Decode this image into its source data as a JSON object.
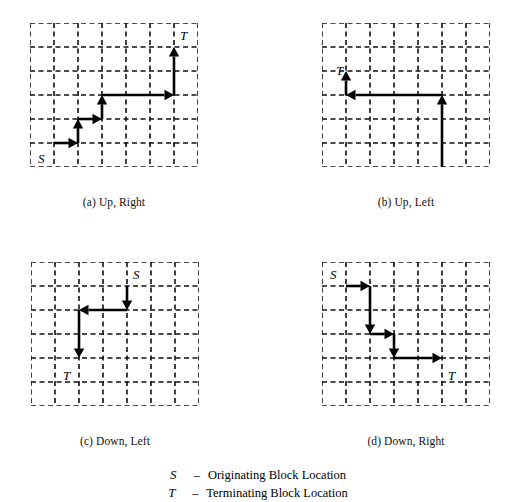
{
  "figure": {
    "grid": {
      "cell": 24,
      "cols": 7,
      "rows": 6,
      "line_color": "#111111",
      "dash": "5,3.5",
      "line_width": 1.6
    },
    "path_color": "#000000",
    "path_width": 2.6
  },
  "panels": [
    {
      "id": "a",
      "caption": "(a) Up, Right",
      "start_label": "S",
      "end_label": "T",
      "direction_pair": "Up, Right",
      "start_label_pos": {
        "x": 8,
        "y": 140
      },
      "end_label_pos": {
        "x": 150,
        "y": 17
      },
      "segments": [
        {
          "dir": "right",
          "x1": 24,
          "y1": 120,
          "x2": 48,
          "y2": 120
        },
        {
          "dir": "up",
          "x1": 48,
          "y1": 120,
          "x2": 48,
          "y2": 96
        },
        {
          "dir": "right",
          "x1": 48,
          "y1": 96,
          "x2": 72,
          "y2": 96
        },
        {
          "dir": "up",
          "x1": 72,
          "y1": 96,
          "x2": 72,
          "y2": 72
        },
        {
          "dir": "right",
          "x1": 72,
          "y1": 72,
          "x2": 144,
          "y2": 72
        },
        {
          "dir": "up",
          "x1": 144,
          "y1": 72,
          "x2": 144,
          "y2": 24
        }
      ]
    },
    {
      "id": "b",
      "caption": "(b) Up, Left",
      "start_label": "S",
      "end_label": "T",
      "direction_pair": "Up, Left",
      "start_label_pos": {
        "x": 126,
        "y": 162
      },
      "end_label_pos": {
        "x": 14,
        "y": 52
      },
      "segments": [
        {
          "dir": "up",
          "x1": 120,
          "y1": 144,
          "x2": 120,
          "y2": 72
        },
        {
          "dir": "left",
          "x1": 120,
          "y1": 72,
          "x2": 24,
          "y2": 72
        },
        {
          "dir": "up",
          "x1": 24,
          "y1": 72,
          "x2": 24,
          "y2": 48
        }
      ]
    },
    {
      "id": "c",
      "caption": "(c) Down, Left",
      "start_label": "S",
      "end_label": "T",
      "direction_pair": "Down, Left",
      "start_label_pos": {
        "x": 102,
        "y": 17
      },
      "end_label_pos": {
        "x": 32,
        "y": 118
      },
      "segments": [
        {
          "dir": "down",
          "x1": 96,
          "y1": 24,
          "x2": 96,
          "y2": 48
        },
        {
          "dir": "left",
          "x1": 96,
          "y1": 48,
          "x2": 48,
          "y2": 48
        },
        {
          "dir": "down",
          "x1": 48,
          "y1": 48,
          "x2": 48,
          "y2": 96
        }
      ]
    },
    {
      "id": "d",
      "caption": "(d) Down, Right",
      "start_label": "S",
      "end_label": "T",
      "direction_pair": "Down, Right",
      "start_label_pos": {
        "x": 8,
        "y": 17
      },
      "end_label_pos": {
        "x": 126,
        "y": 118
      },
      "segments": [
        {
          "dir": "right",
          "x1": 24,
          "y1": 24,
          "x2": 48,
          "y2": 24
        },
        {
          "dir": "down",
          "x1": 48,
          "y1": 24,
          "x2": 48,
          "y2": 72
        },
        {
          "dir": "right",
          "x1": 48,
          "y1": 72,
          "x2": 72,
          "y2": 72
        },
        {
          "dir": "down",
          "x1": 72,
          "y1": 72,
          "x2": 72,
          "y2": 96
        },
        {
          "dir": "right",
          "x1": 72,
          "y1": 96,
          "x2": 120,
          "y2": 96
        }
      ]
    }
  ],
  "legend": [
    {
      "symbol": "S",
      "dash": "–",
      "text": "Originating Block Location"
    },
    {
      "symbol": "T",
      "dash": "–",
      "text": "Terminating Block Location"
    }
  ]
}
